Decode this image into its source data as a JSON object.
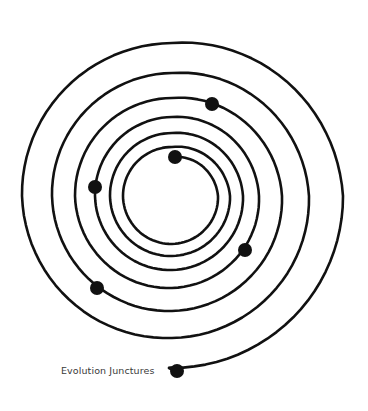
{
  "diagram": {
    "type": "spiral",
    "center": [
      172,
      196
    ],
    "stroke_color": "#111111",
    "stroke_width": 2.6,
    "dot_color": "#111111",
    "dot_radius": 7,
    "quarter_turn_radii": [
      39,
      46,
      48,
      49,
      49,
      58,
      60,
      62,
      63,
      71,
      74,
      77,
      79,
      87,
      92,
      97,
      98,
      110,
      115,
      120,
      123,
      137,
      142,
      150,
      153,
      171,
      172
    ],
    "end_point": [
      177,
      371
    ],
    "dots": [
      {
        "name": "start-dot",
        "x": 175,
        "y": 157
      },
      {
        "name": "juncture-dot-1",
        "x": 245,
        "y": 250
      },
      {
        "name": "juncture-dot-2",
        "x": 95,
        "y": 187
      },
      {
        "name": "juncture-dot-3",
        "x": 212,
        "y": 104
      },
      {
        "name": "juncture-dot-4",
        "x": 97,
        "y": 288
      },
      {
        "name": "end-dot",
        "x": 177,
        "y": 371
      }
    ]
  },
  "label": {
    "text": "Evolution Junctures",
    "x": 61,
    "y": 365
  }
}
